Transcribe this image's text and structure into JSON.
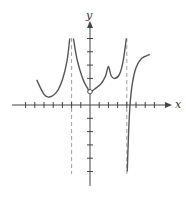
{
  "chart_data": {
    "type": "line",
    "title": "",
    "xlabel": "x",
    "ylabel": "y",
    "xlim": [
      -7,
      7
    ],
    "ylim": [
      -6,
      5
    ],
    "grid": false,
    "x_ticks": [
      -7,
      -6,
      -5,
      -4,
      -3,
      -2,
      -1,
      1,
      2,
      3,
      4,
      5,
      6,
      7
    ],
    "y_ticks": [
      -5,
      -4,
      -3,
      -2,
      -1,
      1,
      2,
      3,
      4,
      5
    ],
    "tick_labels_shown": false,
    "vertical_asymptotes": [
      -2,
      4
    ],
    "open_points": [
      {
        "x": 0,
        "y": 1
      }
    ],
    "series": [
      {
        "name": "left-branch",
        "points": [
          [
            -5.8,
            1.9
          ],
          [
            -5,
            0.8
          ],
          [
            -4.4,
            0.6
          ],
          [
            -3.6,
            1.0
          ],
          [
            -3,
            1.9
          ],
          [
            -2.5,
            3.3
          ],
          [
            -2.2,
            5
          ]
        ]
      },
      {
        "name": "middle-branch",
        "points": [
          [
            -1.8,
            5
          ],
          [
            -1.4,
            3.4
          ],
          [
            -0.8,
            2.0
          ],
          [
            -0.3,
            1.3
          ],
          [
            0,
            1
          ],
          [
            0.5,
            1.2
          ],
          [
            1.2,
            1.6
          ],
          [
            1.7,
            2.2
          ],
          [
            2,
            2.9
          ],
          [
            2.3,
            2.2
          ],
          [
            2.7,
            2.0
          ],
          [
            3.2,
            2.3
          ],
          [
            3.6,
            3.3
          ],
          [
            3.95,
            5
          ]
        ]
      },
      {
        "name": "right-branch",
        "points": [
          [
            4.05,
            -5
          ],
          [
            4.2,
            -2
          ],
          [
            4.35,
            0
          ],
          [
            4.6,
            1.6
          ],
          [
            5.0,
            2.8
          ],
          [
            5.6,
            3.5
          ],
          [
            6.5,
            3.8
          ]
        ]
      }
    ]
  },
  "labels": {
    "x_axis": "x",
    "y_axis": "y"
  },
  "colors": {
    "curve": "#555555",
    "axis": "#444444",
    "asymptote": "#888888"
  }
}
